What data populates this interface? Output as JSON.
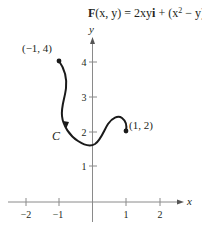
{
  "formula": {
    "F": "F",
    "args": "(x, y) = 2xy",
    "i": "i",
    "mid": " + (x",
    "exp": "2",
    "tail": " − y)",
    "j": "j"
  },
  "axes": {
    "x_label": "x",
    "y_label": "y",
    "x_ticks": [
      {
        "value": -2,
        "label": "−2"
      },
      {
        "value": -1,
        "label": "−1"
      },
      {
        "value": 1,
        "label": "1"
      },
      {
        "value": 2,
        "label": "2"
      }
    ],
    "y_ticks": [
      {
        "value": 1,
        "label": "1"
      },
      {
        "value": 2,
        "label": "2"
      },
      {
        "value": 3,
        "label": "3"
      },
      {
        "value": 4,
        "label": "4"
      }
    ]
  },
  "curve": {
    "name": "C",
    "start_label": "(−1, 4)",
    "end_label": "(1, 2)",
    "start": [
      -1,
      4
    ],
    "end": [
      1,
      2
    ]
  },
  "colors": {
    "axis": "#8a8a8a",
    "curve": "#1a1a1a",
    "text": "#231f20"
  }
}
